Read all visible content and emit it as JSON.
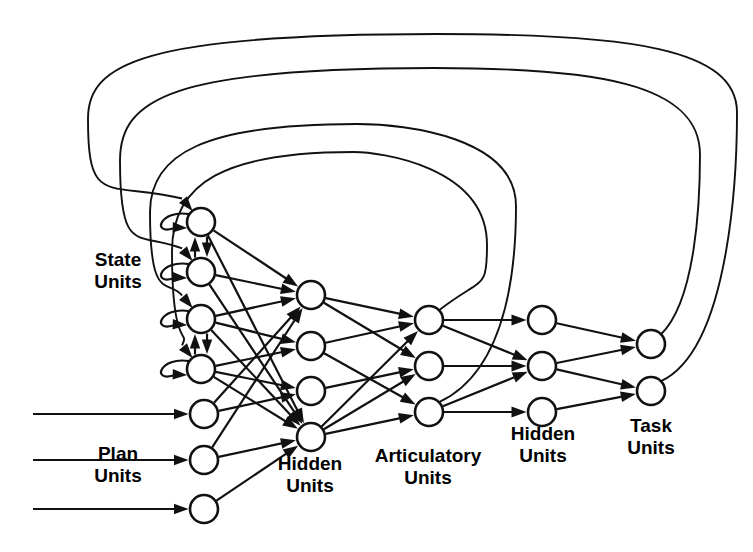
{
  "figure": {
    "kind": "neural-network-architecture-diagram",
    "background_color": "#ffffff",
    "line_color": "#111111",
    "node_fill": "#ffffff"
  },
  "labels": {
    "state": {
      "line1": "State",
      "line2": "Units",
      "x": 118,
      "y": 266
    },
    "plan": {
      "line1": "Plan",
      "line2": "Units",
      "x": 118,
      "y": 460
    },
    "hidden1": {
      "line1": "Hidden",
      "line2": "Units",
      "x": 310,
      "y": 470
    },
    "articulatory": {
      "line1": "Articulatory",
      "line2": "Units",
      "x": 428,
      "y": 462
    },
    "hidden2": {
      "line1": "Hidden",
      "line2": "Units",
      "x": 543,
      "y": 440
    },
    "task": {
      "line1": "Task",
      "line2": "Units",
      "x": 651,
      "y": 432
    }
  },
  "layers": [
    {
      "name": "state-units",
      "label": "State Units",
      "count": 4,
      "radius": 14,
      "nodes": [
        {
          "id": "s1",
          "cx": 201,
          "cy": 222
        },
        {
          "id": "s2",
          "cx": 201,
          "cy": 272
        },
        {
          "id": "s3",
          "cx": 201,
          "cy": 319
        },
        {
          "id": "s4",
          "cx": 201,
          "cy": 369
        }
      ]
    },
    {
      "name": "plan-units",
      "label": "Plan Units",
      "count": 3,
      "radius": 14,
      "nodes": [
        {
          "id": "p1",
          "cx": 204,
          "cy": 414
        },
        {
          "id": "p2",
          "cx": 204,
          "cy": 460
        },
        {
          "id": "p3",
          "cx": 204,
          "cy": 509
        }
      ]
    },
    {
      "name": "hidden-units-1",
      "label": "Hidden Units",
      "count": 4,
      "radius": 14,
      "nodes": [
        {
          "id": "h1",
          "cx": 311,
          "cy": 295
        },
        {
          "id": "h2",
          "cx": 311,
          "cy": 346
        },
        {
          "id": "h3",
          "cx": 311,
          "cy": 391
        },
        {
          "id": "h4",
          "cx": 311,
          "cy": 437
        }
      ]
    },
    {
      "name": "articulatory-units",
      "label": "Articulatory Units",
      "count": 3,
      "radius": 14,
      "nodes": [
        {
          "id": "a1",
          "cx": 429,
          "cy": 320
        },
        {
          "id": "a2",
          "cx": 429,
          "cy": 366
        },
        {
          "id": "a3",
          "cx": 429,
          "cy": 412
        }
      ]
    },
    {
      "name": "hidden-units-2",
      "label": "Hidden Units",
      "count": 3,
      "radius": 14,
      "nodes": [
        {
          "id": "g1",
          "cx": 542,
          "cy": 320
        },
        {
          "id": "g2",
          "cx": 542,
          "cy": 366
        },
        {
          "id": "g3",
          "cx": 542,
          "cy": 412
        }
      ]
    },
    {
      "name": "task-units",
      "label": "Task Units",
      "count": 2,
      "radius": 14,
      "nodes": [
        {
          "id": "t1",
          "cx": 651,
          "cy": 344
        },
        {
          "id": "t2",
          "cx": 651,
          "cy": 391
        }
      ]
    }
  ],
  "external_inputs": [
    {
      "target": "p1",
      "from_x": 33,
      "y": 414
    },
    {
      "target": "p2",
      "from_x": 33,
      "y": 460
    },
    {
      "target": "p3",
      "from_x": 33,
      "y": 509
    }
  ],
  "self_loops": [
    "s1",
    "s2",
    "s3",
    "s4"
  ],
  "lateral_pairs": [
    {
      "a": "s1",
      "b": "s2"
    },
    {
      "a": "s3",
      "b": "s4"
    }
  ],
  "feedback_arcs": [
    {
      "from": "t2",
      "to": "s1",
      "depth": 1
    },
    {
      "from": "t1",
      "to": "s2",
      "depth": 2
    },
    {
      "from": "a3",
      "to": "s3",
      "depth": 3
    },
    {
      "from": "a1",
      "to": "s4",
      "depth": 4
    }
  ],
  "forward_edges": [
    {
      "from": "s1",
      "to": "h1"
    },
    {
      "from": "s1",
      "to": "h4"
    },
    {
      "from": "s2",
      "to": "h1"
    },
    {
      "from": "s2",
      "to": "h4"
    },
    {
      "from": "s3",
      "to": "h1"
    },
    {
      "from": "s3",
      "to": "h2"
    },
    {
      "from": "s3",
      "to": "h4"
    },
    {
      "from": "s4",
      "to": "h2"
    },
    {
      "from": "s4",
      "to": "h3"
    },
    {
      "from": "s4",
      "to": "h4"
    },
    {
      "from": "p1",
      "to": "h1"
    },
    {
      "from": "p1",
      "to": "h3"
    },
    {
      "from": "p2",
      "to": "h1"
    },
    {
      "from": "p2",
      "to": "h4"
    },
    {
      "from": "p3",
      "to": "h4"
    },
    {
      "from": "h1",
      "to": "a1"
    },
    {
      "from": "h1",
      "to": "a2"
    },
    {
      "from": "h2",
      "to": "a1"
    },
    {
      "from": "h2",
      "to": "a3"
    },
    {
      "from": "h3",
      "to": "a2"
    },
    {
      "from": "h4",
      "to": "a1"
    },
    {
      "from": "h4",
      "to": "a2"
    },
    {
      "from": "h4",
      "to": "a3"
    },
    {
      "from": "a1",
      "to": "g1"
    },
    {
      "from": "a1",
      "to": "g2"
    },
    {
      "from": "a2",
      "to": "g2"
    },
    {
      "from": "a3",
      "to": "g2"
    },
    {
      "from": "a3",
      "to": "g3"
    },
    {
      "from": "g1",
      "to": "t1"
    },
    {
      "from": "g2",
      "to": "t1"
    },
    {
      "from": "g2",
      "to": "t2"
    },
    {
      "from": "g3",
      "to": "t2"
    }
  ]
}
